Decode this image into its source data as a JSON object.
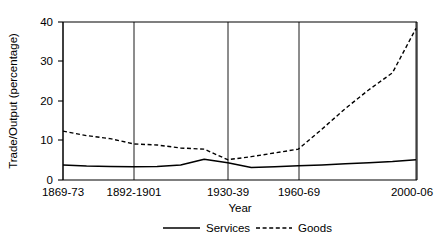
{
  "chart_data": {
    "type": "line",
    "title": "",
    "xlabel": "Year",
    "ylabel": "Trade/Output (percentage)",
    "ylim": [
      0,
      42
    ],
    "yticks": [
      0,
      10,
      20,
      30,
      40
    ],
    "ytick_labels": [
      "0",
      "10",
      "20",
      "30",
      "40"
    ],
    "xtick_labels": [
      "1869-73",
      "1892-1901",
      "1930-39",
      "1960-69",
      "2000-06"
    ],
    "xtick_positions": [
      0,
      3,
      7,
      10,
      15
    ],
    "grid": "vertical-only",
    "legend_position": "bottom",
    "legend": [
      "Services",
      "Goods"
    ],
    "x": [
      0,
      1,
      2,
      3,
      4,
      5,
      6,
      7,
      8,
      9,
      10,
      11,
      12,
      13,
      14,
      15
    ],
    "x_period_labels": [
      "1869-73",
      "1874-83",
      "1884-91",
      "1892-1901",
      "1902-13",
      "1914-20",
      "1921-29",
      "1930-39",
      "1946-52",
      "1953-59",
      "1960-69",
      "1970-79",
      "1980-89",
      "1990-94",
      "1995-99",
      "2000-06"
    ],
    "series": [
      {
        "name": "Services",
        "style": "solid",
        "color": "#000000",
        "values": [
          4.0,
          3.7,
          3.6,
          3.5,
          3.6,
          4.0,
          5.5,
          4.6,
          3.3,
          3.5,
          3.8,
          4.0,
          4.3,
          4.6,
          4.9,
          5.4
        ]
      },
      {
        "name": "Goods",
        "style": "dashed",
        "color": "#000000",
        "values": [
          13.0,
          11.8,
          11.0,
          9.6,
          9.3,
          8.5,
          8.2,
          5.4,
          6.2,
          7.2,
          8.2,
          13.5,
          19.0,
          24.0,
          28.5,
          40.3
        ]
      }
    ]
  }
}
